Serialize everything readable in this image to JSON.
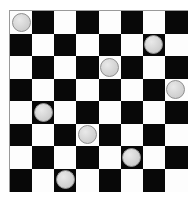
{
  "board": {
    "name": "checkers-board",
    "rows": 8,
    "cols": 8,
    "light_color": "#fdfdfd",
    "dark_color": "#080808",
    "border_color": "#9a9a9a",
    "background_color": "#ffffff",
    "origin_x": 9,
    "origin_y": 10,
    "width": 179,
    "height": 182,
    "cell_width": 22.2,
    "cell_height": 22.5,
    "top_left_square": "light",
    "squares": [
      [
        "light",
        "dark",
        "light",
        "dark",
        "light",
        "dark",
        "light",
        "dark"
      ],
      [
        "dark",
        "light",
        "dark",
        "light",
        "dark",
        "light",
        "dark",
        "light"
      ],
      [
        "light",
        "dark",
        "light",
        "dark",
        "light",
        "dark",
        "light",
        "dark"
      ],
      [
        "dark",
        "light",
        "dark",
        "light",
        "dark",
        "light",
        "dark",
        "light"
      ],
      [
        "light",
        "dark",
        "light",
        "dark",
        "light",
        "dark",
        "light",
        "dark"
      ],
      [
        "dark",
        "light",
        "dark",
        "light",
        "dark",
        "light",
        "dark",
        "light"
      ],
      [
        "light",
        "dark",
        "light",
        "dark",
        "light",
        "dark",
        "light",
        "dark"
      ],
      [
        "dark",
        "light",
        "dark",
        "light",
        "dark",
        "light",
        "dark",
        "light"
      ]
    ]
  },
  "pieces": {
    "count": 8,
    "fill_color": "#d2d2d2",
    "outline_color": "#8f8f8f",
    "diameter": 19,
    "items": [
      {
        "id": "piece-r0c0",
        "row": 0,
        "col": 0,
        "square": "light"
      },
      {
        "id": "piece-r1c6",
        "row": 1,
        "col": 6,
        "square": "dark"
      },
      {
        "id": "piece-r2c4",
        "row": 2,
        "col": 4,
        "square": "light"
      },
      {
        "id": "piece-r3c7",
        "row": 3,
        "col": 7,
        "square": "light"
      },
      {
        "id": "piece-r4c1",
        "row": 4,
        "col": 1,
        "square": "dark"
      },
      {
        "id": "piece-r5c3",
        "row": 5,
        "col": 3,
        "square": "light"
      },
      {
        "id": "piece-r6c5",
        "row": 6,
        "col": 5,
        "square": "dark"
      },
      {
        "id": "piece-r7c2",
        "row": 7,
        "col": 2,
        "square": "dark"
      }
    ]
  }
}
